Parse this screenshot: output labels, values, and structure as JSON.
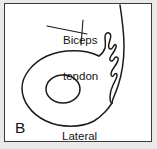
{
  "figure": {
    "panel_letter": "B",
    "labels": {
      "biceps_tendon_line1": "Biceps",
      "biceps_tendon_line2": "tendon",
      "orientation": "Lateral"
    },
    "colors": {
      "background": "#e9e9e9",
      "panel_fill": "#ffffff",
      "panel_border": "#3a3a3a",
      "ink": "#1a1a1a"
    },
    "structures": [
      "humeral-head-outline",
      "inner-ellipse",
      "biceps-tendon-groove",
      "outer-cortical-arc"
    ]
  }
}
